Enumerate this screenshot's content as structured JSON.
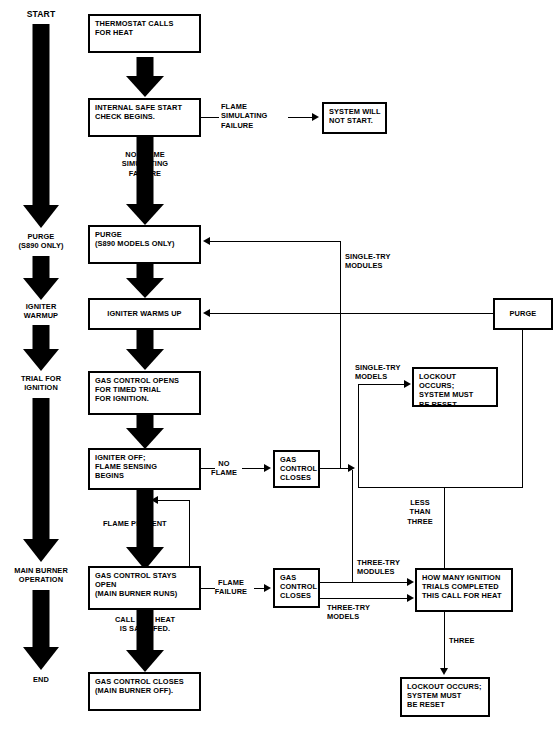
{
  "diagram": {
    "stages": [
      {
        "label": "START"
      },
      {
        "label": "PURGE\n(S890 ONLY)"
      },
      {
        "label": "IGNITER\nWARMUP"
      },
      {
        "label": "TRIAL FOR\nIGNITION"
      },
      {
        "label": "MAIN BURNER\nOPERATION"
      },
      {
        "label": "END"
      }
    ],
    "boxes": [
      {
        "id": "thermostat",
        "text": "THERMOSTAT CALLS\nFOR HEAT"
      },
      {
        "id": "safe_start",
        "text": "INTERNAL SAFE START\nCHECK BEGINS."
      },
      {
        "id": "no_start",
        "text": "SYSTEM WILL\nNOT START."
      },
      {
        "id": "purge_main",
        "text": "PURGE\n(S890 MODELS ONLY)"
      },
      {
        "id": "igniter_warms",
        "text": "IGNITER WARMS UP"
      },
      {
        "id": "gas_opens",
        "text": "GAS CONTROL OPENS\nFOR TIMED TRIAL\nFOR IGNITION."
      },
      {
        "id": "igniter_off",
        "text": "IGNITER OFF;\nFLAME SENSING\nBEGINS"
      },
      {
        "id": "gas_closes_1",
        "text": "GAS\nCONTROL\nCLOSES"
      },
      {
        "id": "gas_stays_open",
        "text": "GAS CONTROL STAYS\nOPEN\n(MAIN BURNER RUNS)"
      },
      {
        "id": "gas_closes_2",
        "text": "GAS\nCONTROL\nCLOSES"
      },
      {
        "id": "gas_closes_final",
        "text": "GAS CONTROL CLOSES\n(MAIN BURNER OFF)."
      },
      {
        "id": "purge_right",
        "text": "PURGE"
      },
      {
        "id": "lockout_1",
        "text": "LOCKOUT OCCURS;\nSYSTEM MUST\nBE RESET"
      },
      {
        "id": "how_many",
        "text": "HOW MANY IGNITION\nTRIALS COMPLETED\nTHIS CALL FOR HEAT"
      },
      {
        "id": "lockout_2",
        "text": "LOCKOUT OCCURS;\nSYSTEM MUST\nBE RESET"
      }
    ],
    "edge_labels": [
      {
        "id": "flame_sim_fail",
        "text": "FLAME\nSIMULATING\nFAILURE"
      },
      {
        "id": "no_flame_sim_fail",
        "text": "NO FLAME\nSIMULATING\nFAILURE"
      },
      {
        "id": "single_try_mod_top",
        "text": "SINGLE-TRY\nMODULES"
      },
      {
        "id": "single_try_mod_mid",
        "text": "SINGLE-TRY\nMODELS"
      },
      {
        "id": "no_flame",
        "text": "NO\nFLAME"
      },
      {
        "id": "flame_present",
        "text": "FLAME PRESENT"
      },
      {
        "id": "less_than_three",
        "text": "LESS\nTHAN\nTHREE"
      },
      {
        "id": "three_try_modules",
        "text": "THREE-TRY\nMODULES"
      },
      {
        "id": "flame_failure",
        "text": "FLAME\nFAILURE"
      },
      {
        "id": "three_try_models",
        "text": "THREE-TRY\nMODELS"
      },
      {
        "id": "call_satisfied",
        "text": "CALL FOR HEAT\nIS SATISIFED."
      },
      {
        "id": "three",
        "text": "THREE"
      }
    ],
    "colors": {
      "ink": "#000000",
      "paper": "#ffffff"
    }
  }
}
